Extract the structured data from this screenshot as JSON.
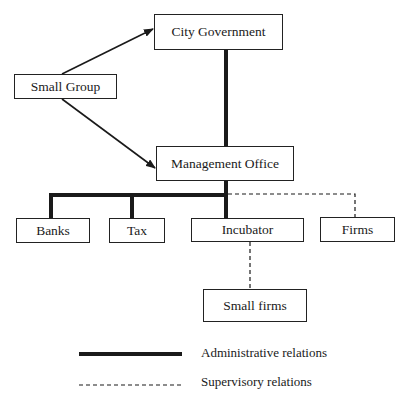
{
  "diagram": {
    "type": "organizational-structure",
    "nodes": {
      "city_government": "City Government",
      "small_group": "Small Group",
      "management_office": "Management Office",
      "banks": "Banks",
      "tax": "Tax",
      "incubator": "Incubator",
      "firms": "Firms",
      "small_firms": "Small firms"
    },
    "edges": [
      {
        "from": "Small Group",
        "to": "City Government",
        "style": "arrow"
      },
      {
        "from": "Small Group",
        "to": "Management Office",
        "style": "arrow"
      },
      {
        "from": "City Government",
        "to": "Management Office",
        "style": "administrative"
      },
      {
        "from": "Management Office",
        "to": "Banks",
        "style": "administrative"
      },
      {
        "from": "Management Office",
        "to": "Tax",
        "style": "administrative"
      },
      {
        "from": "Management Office",
        "to": "Incubator",
        "style": "administrative"
      },
      {
        "from": "Management Office",
        "to": "Firms",
        "style": "supervisory"
      },
      {
        "from": "Incubator",
        "to": "Small firms",
        "style": "supervisory"
      }
    ]
  },
  "legend": {
    "administrative": "Administrative relations",
    "supervisory": "Supervisory relations"
  },
  "colors": {
    "line": "#1a1a1a",
    "background": "#ffffff"
  }
}
